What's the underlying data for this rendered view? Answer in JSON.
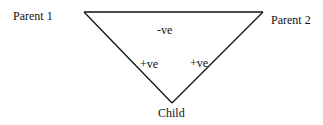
{
  "diagram": {
    "nodes": {
      "parent1": "Parent 1",
      "parent2": "Parent 2",
      "child": "Child"
    },
    "edges": {
      "parent1_parent2": "-ve",
      "parent1_child": "+ve",
      "parent2_child": "+ve"
    },
    "line_color": "#111111"
  }
}
